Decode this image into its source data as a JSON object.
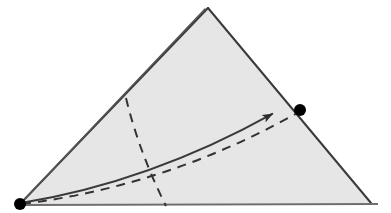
{
  "figure": {
    "kind": "geometric-diagram",
    "canvas": {
      "width": 391,
      "height": 213,
      "background": "#ffffff"
    },
    "colors": {
      "fill": "#ebebeb",
      "fill_alt": "#e7e7e7",
      "stroke": "#3a3a3a",
      "stroke_soft": "#555555",
      "dash": "#333333",
      "vertex": "#000000",
      "baseline": "#6e6e6e"
    },
    "stroke_widths": {
      "outline": 2.0,
      "crease": 1.6,
      "curve": 2.0,
      "dash": 2.0,
      "baseline": 2.2
    }
  },
  "geometry": {
    "triangle": {
      "label": "shaded-triangle",
      "apex": {
        "x": 208,
        "y": 8
      },
      "bottom_left": {
        "x": 20,
        "y": 204
      },
      "bottom_right": {
        "x": 371,
        "y": 203
      },
      "points": "208,8 371,203 20,204",
      "fill": "#ebebeb"
    },
    "crease_line": {
      "label": "double-left-edge",
      "from": {
        "x": 205,
        "y": 9
      },
      "to": {
        "x": 20,
        "y": 204
      },
      "offset_px": 4,
      "note": "second parallel line inboard of the left edge, converging at apex"
    },
    "baseline": {
      "label": "bottom-edge",
      "from": {
        "x": 20,
        "y": 205
      },
      "to": {
        "x": 378,
        "y": 204
      }
    },
    "solid_curve": {
      "label": "geodesic-arrow-curve",
      "start": {
        "x": 21,
        "y": 203
      },
      "control": {
        "x": 150,
        "y": 182
      },
      "end": {
        "x": 281,
        "y": 109
      },
      "has_arrowhead": true,
      "arrowhead_at": {
        "x": 281,
        "y": 109
      },
      "arrowhead_angle_deg": -18
    },
    "dashed_curve": {
      "label": "lower-dashed-curve",
      "start": {
        "x": 22,
        "y": 204
      },
      "control": {
        "x": 168,
        "y": 186
      },
      "end": {
        "x": 299,
        "y": 112
      },
      "dasharray": "9,7"
    },
    "dashed_vertical": {
      "label": "dashed-cross-section-line",
      "start": {
        "x": 126,
        "y": 98
      },
      "control": {
        "x": 139,
        "y": 152
      },
      "end": {
        "x": 166,
        "y": 206
      },
      "dasharray": "9,7"
    },
    "vertices": [
      {
        "name": "vertex-left",
        "x": 20,
        "y": 204,
        "r": 6.0,
        "filled": true
      },
      {
        "name": "vertex-right",
        "x": 300,
        "y": 110,
        "r": 6.0,
        "filled": true
      }
    ]
  },
  "accessibility": {
    "alt_text": "A light gray shaded triangle. A solid curved arrow runs from the filled dot at the bottom-left vertex up to a filled dot on the right edge. A dashed curve runs below it between the same two points, and a near-vertical dashed line crosses the triangle from the left edge down to the base. The left edge is drawn as a double line."
  }
}
